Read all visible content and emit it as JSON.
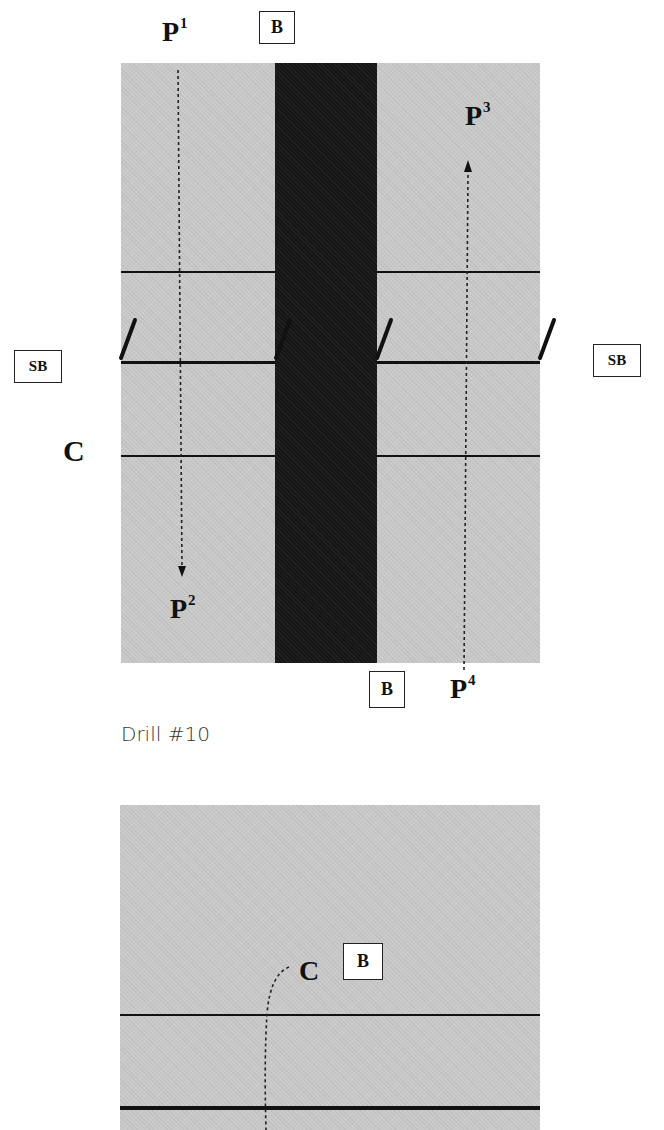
{
  "diagram1": {
    "labels": {
      "p1": {
        "base": "P",
        "sup": "1"
      },
      "p2": {
        "base": "P",
        "sup": "2"
      },
      "p3": {
        "base": "P",
        "sup": "3"
      },
      "p4": {
        "base": "P",
        "sup": "4"
      },
      "c": "C"
    },
    "box_labels": {
      "b_top": "B",
      "b_bottom": "B",
      "sb_left": "SB",
      "sb_right": "SB"
    },
    "caption": "Drill #10",
    "colors": {
      "court": "#c9c9c9",
      "lane": "#161616",
      "line": "#111111"
    }
  },
  "diagram2": {
    "labels": {
      "c": "C"
    },
    "box_labels": {
      "b": "B"
    }
  }
}
